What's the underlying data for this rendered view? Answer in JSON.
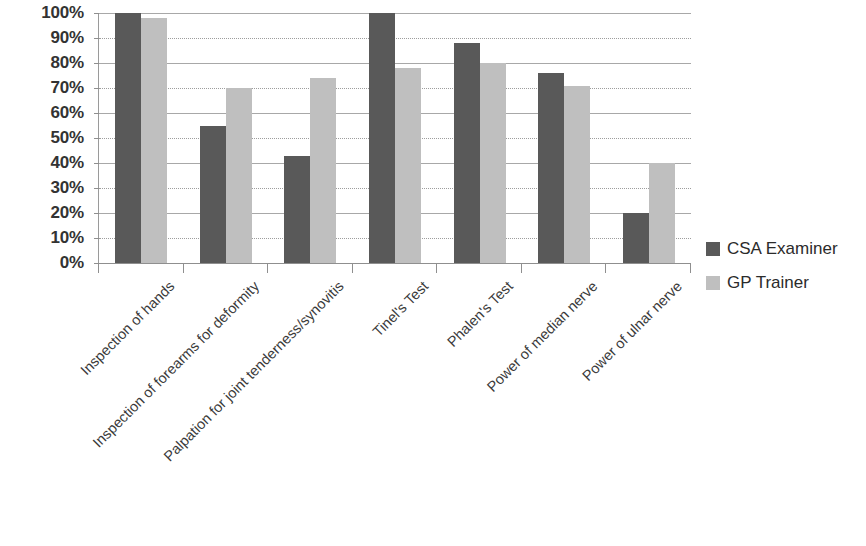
{
  "chart_data": {
    "type": "bar",
    "title": "",
    "subtitle": "",
    "xlabel": "",
    "ylabel": "",
    "ylim": [
      0,
      100
    ],
    "yticks": [
      "0%",
      "10%",
      "20%",
      "30%",
      "40%",
      "50%",
      "60%",
      "70%",
      "80%",
      "90%",
      "100%"
    ],
    "ytick_values": [
      0,
      10,
      20,
      30,
      40,
      50,
      60,
      70,
      80,
      90,
      100
    ],
    "grid": true,
    "legend_position": "right",
    "categories": [
      "Inspection of hands",
      "Inspection of forearms for deformity",
      "Palpation for joint tenderness/synovitis",
      "Tinel's Test",
      "Phalen's Test",
      "Power of median nerve",
      "Power of ulnar nerve"
    ],
    "series": [
      {
        "name": "CSA Examiner",
        "color": "#595959",
        "values": [
          100,
          55,
          43,
          100,
          88,
          76,
          20
        ]
      },
      {
        "name": "GP Trainer",
        "color": "#bfbfbf",
        "values": [
          98,
          70,
          74,
          78,
          80,
          71,
          40
        ]
      }
    ]
  },
  "legend": {
    "items": [
      {
        "label": "CSA Examiner",
        "color": "#595959"
      },
      {
        "label": "GP Trainer",
        "color": "#bfbfbf"
      }
    ]
  },
  "colors": {
    "series_dark": "#595959",
    "series_light": "#bfbfbf",
    "gridline": "#a8a8a8",
    "axis": "#8f8f8f",
    "text": "#2b2b2b",
    "background": "#ffffff"
  }
}
